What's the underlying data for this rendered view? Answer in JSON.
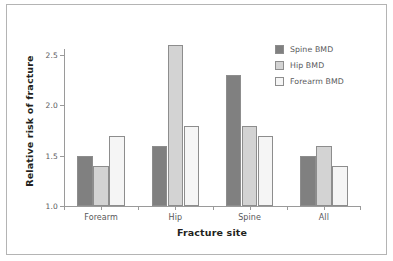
{
  "chart_data": {
    "type": "bar",
    "title": "",
    "xlabel": "Fracture site",
    "ylabel": "Relative risk of fracture",
    "categories": [
      "Forearm",
      "Hip",
      "Spine",
      "All"
    ],
    "series": [
      {
        "name": "Spine BMD",
        "color": "#808080",
        "values": [
          1.5,
          1.6,
          2.3,
          1.5
        ]
      },
      {
        "name": "Hip BMD",
        "color": "#d3d3d3",
        "values": [
          1.4,
          2.6,
          1.8,
          1.6
        ]
      },
      {
        "name": "Forearm BMD",
        "color": "#f5f5f5",
        "values": [
          1.7,
          1.8,
          1.7,
          1.4
        ]
      }
    ],
    "ylim": [
      1.0,
      2.7
    ],
    "baseline": 1.0,
    "yticks": [
      "1.0",
      "1.5",
      "2.0",
      "2.5"
    ],
    "ytick_values": [
      1.0,
      1.5,
      2.0,
      2.5
    ],
    "grid": false,
    "legend_position": "top-right"
  },
  "legend": {
    "items": [
      {
        "label": "Spine BMD"
      },
      {
        "label": "Hip BMD"
      },
      {
        "label": "Forearm BMD"
      }
    ]
  },
  "axes": {
    "y_title": "Relative risk of fracture",
    "x_title": "Fracture site"
  }
}
